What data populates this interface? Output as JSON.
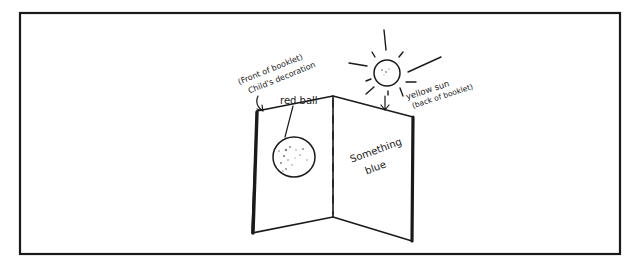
{
  "figure": {
    "labels": {
      "front_line1": "(Front of booklet)",
      "front_line2": "Child's decoration",
      "ball": "red ball",
      "sun_line1": "yellow sun",
      "sun_line2": "(back of booklet)",
      "inside_line1": "Something",
      "inside_line2": "blue"
    },
    "colors": {
      "ink": "#1a1a1a",
      "background": "#ffffff"
    }
  }
}
